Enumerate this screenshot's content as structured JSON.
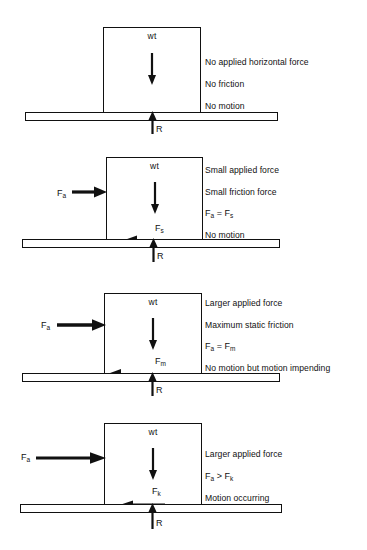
{
  "figure": {
    "stroke_color": "#111111",
    "background": "#ffffff"
  },
  "common": {
    "weight_label": "wt",
    "normal_label": "R"
  },
  "panels": [
    {
      "id": "panel-no-force",
      "weight_label": "wt",
      "normal_label": "R",
      "applied_label": null,
      "applied_sub": null,
      "friction_label": null,
      "friction_sub": null,
      "lines": [
        "No applied horizontal force",
        "No friction",
        "No motion"
      ],
      "equation": null
    },
    {
      "id": "panel-small-force",
      "weight_label": "wt",
      "normal_label": "R",
      "applied_label": "F",
      "applied_sub": "a",
      "friction_label": "F",
      "friction_sub": "s",
      "lines": [
        "Small applied force",
        "Small friction force"
      ],
      "equation": {
        "left": "F",
        "left_sub": "a",
        "operator": "=",
        "right": "F",
        "right_sub": "s"
      },
      "lines_after": [
        "No motion"
      ]
    },
    {
      "id": "panel-max-static",
      "weight_label": "wt",
      "normal_label": "R",
      "applied_label": "F",
      "applied_sub": "a",
      "friction_label": "F",
      "friction_sub": "m",
      "lines": [
        "Larger applied force",
        "Maximum static friction"
      ],
      "equation": {
        "left": "F",
        "left_sub": "a",
        "operator": "=",
        "right": "F",
        "right_sub": "m"
      },
      "lines_after": [
        "No motion but motion impending"
      ]
    },
    {
      "id": "panel-kinetic",
      "weight_label": "wt",
      "normal_label": "R",
      "applied_label": "F",
      "applied_sub": "a",
      "friction_label": "F",
      "friction_sub": "k",
      "lines": [
        "Larger applied force"
      ],
      "equation": {
        "left": "F",
        "left_sub": "a",
        "operator": ">",
        "right": "F",
        "right_sub": "k"
      },
      "lines_after": [
        "Motion occurring"
      ]
    }
  ]
}
